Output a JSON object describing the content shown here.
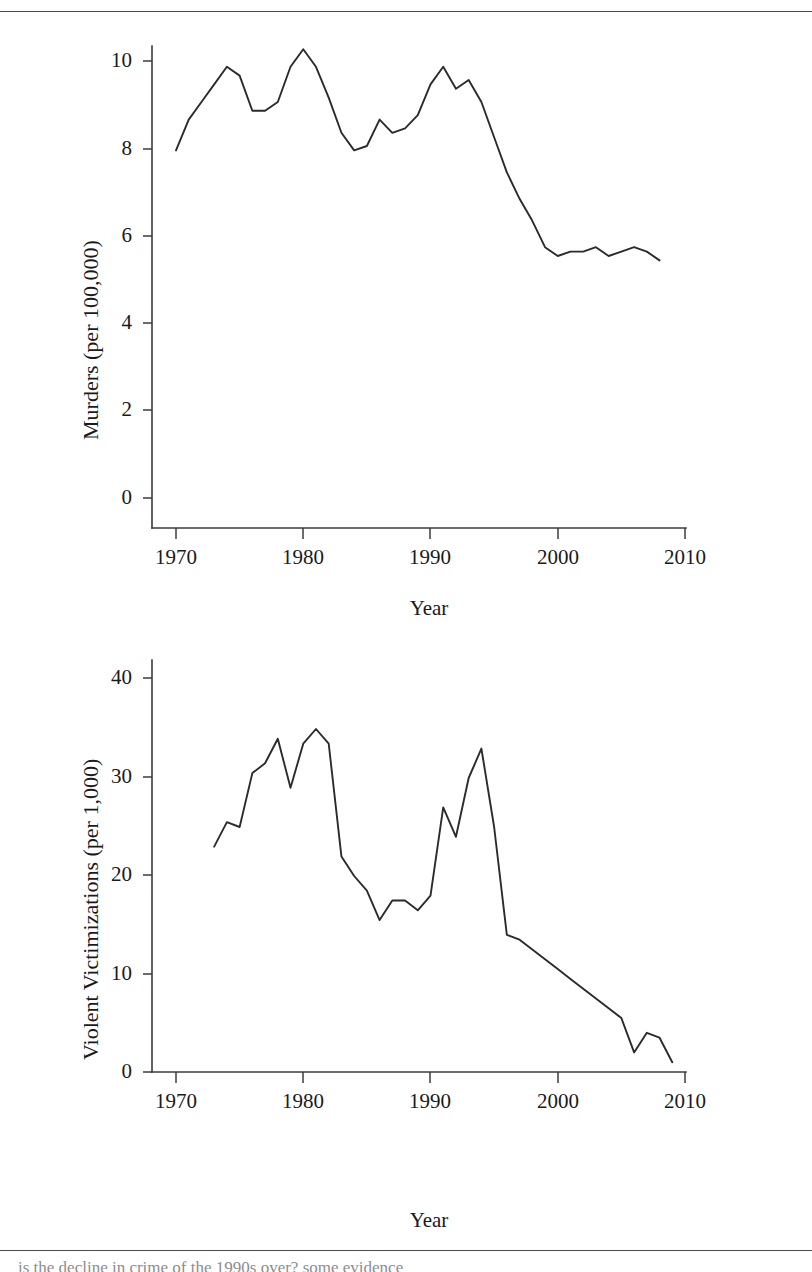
{
  "figure": {
    "top_rule": true,
    "bottom_rule": true,
    "background_color": "#ffffff",
    "line_color": "#2b2b2b",
    "axis_color": "#3b3b3b",
    "caption_partial": "is the decline in crime of the 1990s over? some evidence"
  },
  "chart_data": [
    {
      "type": "line",
      "id": "murders",
      "title": "",
      "xlabel": "Year",
      "ylabel": "Murders (per 100,000)",
      "xlim": [
        1967,
        2011
      ],
      "ylim": [
        0,
        10.8
      ],
      "xticks": [
        1970,
        1980,
        1990,
        2000,
        2010
      ],
      "yticks": [
        0,
        2,
        4,
        6,
        8,
        10
      ],
      "grid": false,
      "legend": "none",
      "x": [
        1970,
        1971,
        1972,
        1973,
        1974,
        1975,
        1976,
        1977,
        1978,
        1979,
        1980,
        1981,
        1982,
        1983,
        1984,
        1985,
        1986,
        1987,
        1988,
        1989,
        1990,
        1991,
        1992,
        1993,
        1994,
        1995,
        1996,
        1997,
        1998,
        1999,
        2000,
        2001,
        2002,
        2003,
        2004,
        2005,
        2006,
        2007,
        2008
      ],
      "values": [
        7.9,
        8.6,
        9.0,
        9.4,
        9.8,
        9.6,
        8.8,
        8.8,
        9.0,
        9.8,
        10.2,
        9.8,
        9.1,
        8.3,
        7.9,
        8.0,
        8.6,
        8.3,
        8.4,
        8.7,
        9.4,
        9.8,
        9.3,
        9.5,
        9.0,
        8.2,
        7.4,
        6.8,
        6.3,
        5.7,
        5.5,
        5.6,
        5.6,
        5.7,
        5.5,
        5.6,
        5.7,
        5.6,
        5.4
      ]
    },
    {
      "type": "line",
      "id": "violent-victimizations",
      "title": "",
      "xlabel": "Year",
      "ylabel": "Violent Victimizations (per 1,000)",
      "xlim": [
        1967,
        2011
      ],
      "ylim": [
        0,
        43
      ],
      "xticks": [
        1970,
        1980,
        1990,
        2000,
        2010
      ],
      "yticks": [
        0,
        10,
        20,
        30,
        40
      ],
      "grid": false,
      "legend": "none",
      "x": [
        1973,
        1974,
        1975,
        1976,
        1977,
        1978,
        1979,
        1980,
        1981,
        1982,
        1983,
        1984,
        1985,
        1986,
        1987,
        1988,
        1989,
        1990,
        1991,
        1992,
        1993,
        1994,
        1995,
        1996,
        1997,
        1998,
        1999,
        2000,
        2001,
        2002,
        2003,
        2004,
        2005,
        2006,
        2007,
        2008,
        2009
      ],
      "values": [
        23.0,
        25.5,
        25.0,
        30.5,
        31.5,
        34.0,
        29.0,
        33.5,
        35.0,
        33.5,
        22.0,
        20.0,
        18.5,
        15.5,
        17.5,
        17.5,
        16.5,
        18.0,
        27.0,
        24.0,
        30.0,
        33.0,
        25.0,
        14.0,
        13.5,
        12.5,
        11.5,
        10.5,
        9.5,
        8.5,
        7.5,
        6.5,
        5.5,
        2.0,
        4.0,
        3.5,
        1.0
      ]
    }
  ],
  "panels": [
    {
      "ylabel": "Murders (per 100,000)",
      "xlabel": "Year",
      "ytick_labels": [
        "10",
        "8",
        "6",
        "4",
        "2",
        "0"
      ],
      "xtick_labels": [
        "1970",
        "1980",
        "1990",
        "2000",
        "2010"
      ]
    },
    {
      "ylabel": "Violent Victimizations (per 1,000)",
      "xlabel": "Year",
      "ytick_labels": [
        "40",
        "30",
        "20",
        "10",
        "0"
      ],
      "xtick_labels": [
        "1970",
        "1980",
        "1990",
        "2000",
        "2010"
      ]
    }
  ]
}
